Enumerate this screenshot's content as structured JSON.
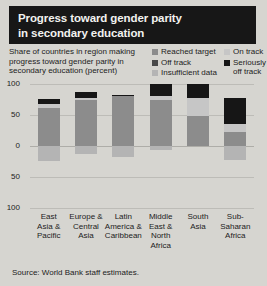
{
  "title": {
    "line1": "Progress toward gender parity",
    "line2": "in secondary education"
  },
  "subtitle": "Share of countries in region making progress toward gender parity in secondary education (percent)",
  "source": "Source: World Bank staff estimates.",
  "legend": [
    {
      "label": "Reached target",
      "color": "#8c8c8c"
    },
    {
      "label": "Off track",
      "color": "#4a4a4a"
    },
    {
      "label": "Insufficient data",
      "color": "#b4b4b4"
    },
    {
      "label": "On track",
      "color": "#c6c6c6"
    },
    {
      "label": "Seriously off track",
      "color": "#161616"
    }
  ],
  "chart_data": {
    "type": "bar",
    "title": "Progress toward gender parity in secondary education",
    "subtitle": "Share of countries in region making progress toward gender parity in secondary education (percent)",
    "xlabel": "",
    "ylabel": "percent",
    "ylim": [
      -100,
      100
    ],
    "yticks": [
      100,
      50,
      0,
      50,
      100
    ],
    "ytick_labels": [
      "100",
      "50",
      "0",
      "50",
      "100"
    ],
    "grid": true,
    "legend_position": "top-right",
    "stacked": true,
    "diverging": true,
    "note": "Positive segments stack upward from 0; negative segments stack downward from 0.",
    "categories": [
      "East Asia & Pacific",
      "Europe & Central Asia",
      "Latin America & Caribbean",
      "Middle East & North Africa",
      "South Asia",
      "Sub-Saharan Africa"
    ],
    "category_lines": [
      [
        "East",
        "Asia &",
        "Pacific"
      ],
      [
        "Europe &",
        "Central",
        "Asia"
      ],
      [
        "Latin",
        "America &",
        "Caribbean"
      ],
      [
        "Middle",
        "East &",
        "North",
        "Africa"
      ],
      [
        "South",
        "Asia"
      ],
      [
        "Sub-",
        "Saharan",
        "Africa"
      ]
    ],
    "series": [
      {
        "name": "Reached target",
        "color": "#8c8c8c",
        "values": [
          61,
          74,
          80,
          74,
          48,
          23
        ]
      },
      {
        "name": "On track",
        "color": "#c6c6c6",
        "values": [
          6,
          4,
          0,
          6,
          30,
          13
        ]
      },
      {
        "name": "Off track",
        "color": "#4a4a4a",
        "values": [
          0,
          0,
          0,
          0,
          0,
          0
        ]
      },
      {
        "name": "Seriously off track",
        "color": "#161616",
        "values": [
          9,
          9,
          3,
          20,
          22,
          42
        ]
      },
      {
        "name": "Insufficient data",
        "color": "#b4b4b4",
        "values": [
          -24,
          -13,
          -17,
          -6,
          0,
          -22
        ]
      }
    ]
  }
}
